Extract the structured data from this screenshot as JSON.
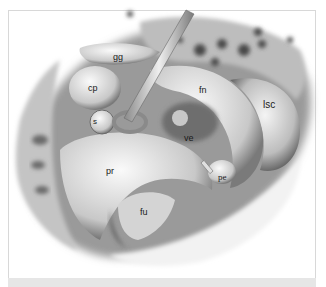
{
  "figure": {
    "labels": [
      {
        "id": "gg",
        "text": "gg",
        "x": 113,
        "y": 55
      },
      {
        "id": "cp",
        "text": "cp",
        "x": 90,
        "y": 85
      },
      {
        "id": "s",
        "text": "s",
        "x": 94,
        "y": 120
      },
      {
        "id": "fn",
        "text": "fn",
        "x": 200,
        "y": 88
      },
      {
        "id": "lsc",
        "text": "lsc",
        "x": 262,
        "y": 102
      },
      {
        "id": "ve",
        "text": "ve",
        "x": 185,
        "y": 136
      },
      {
        "id": "pr",
        "text": "pr",
        "x": 107,
        "y": 170
      },
      {
        "id": "pe",
        "text": "pe",
        "x": 217,
        "y": 175
      },
      {
        "id": "fu",
        "text": "fu",
        "x": 140,
        "y": 210
      }
    ],
    "colors": {
      "frame_border": "#d8d8d8",
      "bottom_strip": "#e6e6e6",
      "bone_light": "#e8e8e8",
      "bone_mid": "#a8a8a8",
      "shadow": "#4a4a4a"
    }
  }
}
